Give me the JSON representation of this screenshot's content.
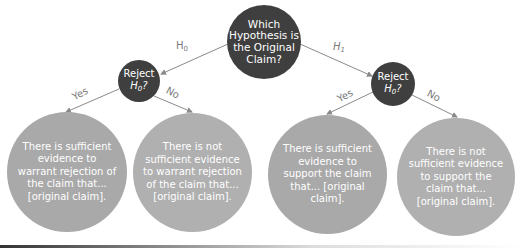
{
  "diagram": {
    "root": {
      "label": "Which Hypothesis is the Original Claim?"
    },
    "branches": [
      {
        "edge_label": "H",
        "edge_sub": "0",
        "decision": {
          "label_top": "Reject",
          "label_h": "H",
          "label_sub": "0",
          "label_q": "?"
        },
        "outcomes": [
          {
            "edge_label": "Yes",
            "text": "There is sufficient evidence to warrant rejection of the claim that... [original claim]."
          },
          {
            "edge_label": "No",
            "text": "There is not sufficient evidence to warrant rejection of the claim that... [original claim]."
          }
        ]
      },
      {
        "edge_label": "H",
        "edge_sub": "1",
        "decision": {
          "label_top": "Reject",
          "label_h": "H",
          "label_sub": "0",
          "label_q": "?"
        },
        "outcomes": [
          {
            "edge_label": "Yes",
            "text": "There is sufficient evidence to support the claim that... [original claim]."
          },
          {
            "edge_label": "No",
            "text": "There is not sufficient evidence to support the claim that... [original claim]."
          }
        ]
      }
    ],
    "colors": {
      "dark_node": "#3f3f3f",
      "leaf_node": "#a9a9a9",
      "edge": "#8a8a8a",
      "edge_label": "#7a7a7a",
      "text_on_node": "#ffffff"
    }
  }
}
